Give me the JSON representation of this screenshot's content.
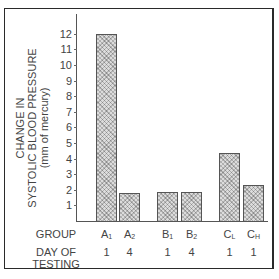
{
  "chart_data": {
    "type": "bar",
    "title": "",
    "ylabel": "CHANGE IN SYSTOLIC BLOOD PRESSURE (mm of mercury)",
    "ylabel_lines": [
      "CHANGE IN",
      "SYSTOLIC BLOOD PRESSURE",
      "(mm of mercury)"
    ],
    "xlabel": "GROUP",
    "ylim": [
      0,
      12.5
    ],
    "yticks": [
      1,
      2,
      3,
      4,
      5,
      6,
      7,
      8,
      9,
      10,
      11,
      12
    ],
    "grid": false,
    "categories": [
      "A1",
      "A2",
      "B1",
      "B2",
      "CL",
      "CH"
    ],
    "category_display": [
      {
        "main": "A",
        "sub": "1"
      },
      {
        "main": "A",
        "sub": "2"
      },
      {
        "main": "B",
        "sub": "1"
      },
      {
        "main": "B",
        "sub": "2"
      },
      {
        "main": "C",
        "sub": "L"
      },
      {
        "main": "C",
        "sub": "H"
      }
    ],
    "values": [
      12.0,
      1.8,
      1.85,
      1.85,
      4.35,
      2.3
    ],
    "day_of_testing": [
      "1",
      "4",
      "1",
      "4",
      "1",
      "1"
    ],
    "row_labels": {
      "group": "GROUP",
      "day_line1": "DAY OF",
      "day_line2": "TESTING"
    }
  }
}
